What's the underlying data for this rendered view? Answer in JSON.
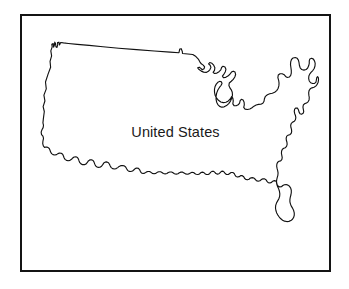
{
  "figure": {
    "name": "united-states-map",
    "label": "United States",
    "frame": {
      "border_color": "#141414",
      "border_width_px": 2,
      "background_color": "#ffffff",
      "left_px": 20,
      "top_px": 14,
      "width_px": 311,
      "height_px": 258
    },
    "outline": {
      "stroke_color": "#111111",
      "fill_color": "#ffffff",
      "stroke_width_px": 1.15
    },
    "label_style": {
      "color": "#1a1a1a",
      "font_size_px": 14.5,
      "align": "center"
    }
  },
  "page": {
    "background_color": "#ffffff",
    "width_px": 349,
    "height_px": 289
  }
}
